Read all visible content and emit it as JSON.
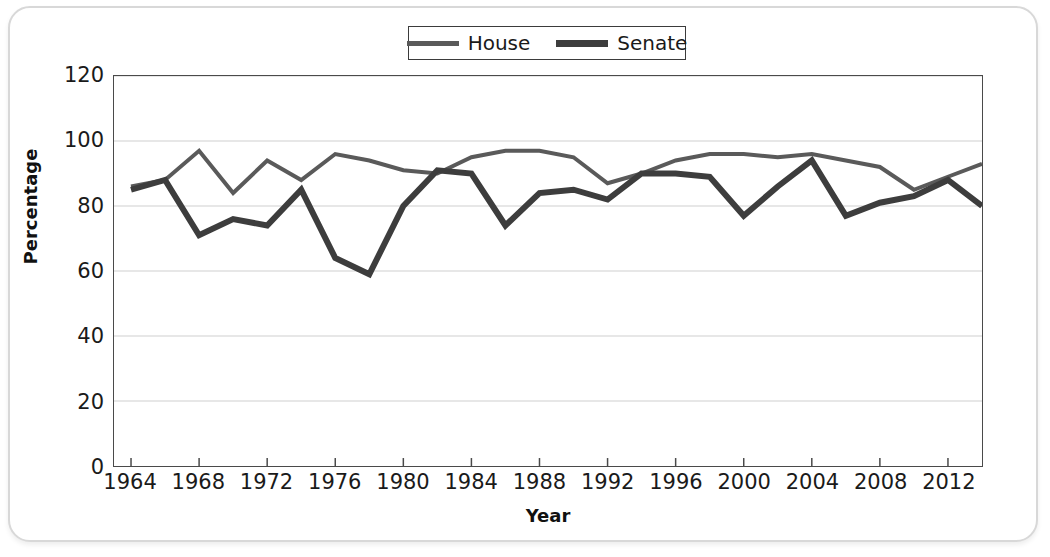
{
  "chart_data": {
    "type": "line",
    "title": "",
    "xlabel": "Year",
    "ylabel": "Percentage",
    "xlim": [
      1963,
      2014
    ],
    "ylim": [
      0,
      120
    ],
    "ytick_values": [
      0,
      20,
      40,
      60,
      80,
      100,
      120
    ],
    "ytick_labels": [
      "0",
      "20",
      "40",
      "60",
      "80",
      "100",
      "120"
    ],
    "xtick_values": [
      1964,
      1968,
      1972,
      1976,
      1980,
      1984,
      1988,
      1992,
      1996,
      2000,
      2004,
      2008,
      2012
    ],
    "xtick_labels": [
      "1964",
      "1968",
      "1972",
      "1976",
      "1980",
      "1984",
      "1988",
      "1992",
      "1996",
      "2000",
      "2004",
      "2008",
      "2012"
    ],
    "grid": "horizontal",
    "legend_position": "top-center",
    "x": [
      1964,
      1966,
      1968,
      1970,
      1972,
      1974,
      1976,
      1978,
      1980,
      1982,
      1984,
      1986,
      1988,
      1990,
      1992,
      1994,
      1996,
      1998,
      2000,
      2002,
      2004,
      2006,
      2008,
      2010,
      2012,
      2014
    ],
    "series": [
      {
        "name": "House",
        "color": "#5a5a5a",
        "line_width": 4,
        "values": [
          86,
          88,
          97,
          84,
          94,
          88,
          96,
          94,
          91,
          90,
          95,
          97,
          97,
          95,
          87,
          90,
          94,
          96,
          96,
          95,
          96,
          94,
          92,
          85,
          89,
          93
        ]
      },
      {
        "name": "Senate",
        "color": "#3d3d3d",
        "line_width": 6,
        "values": [
          85,
          88,
          71,
          76,
          74,
          85,
          64,
          59,
          80,
          91,
          90,
          74,
          84,
          85,
          82,
          90,
          90,
          89,
          77,
          86,
          94,
          77,
          81,
          83,
          88,
          80
        ]
      }
    ]
  },
  "legend": {
    "entries": [
      {
        "label": "House",
        "swatch": "house-line-swatch"
      },
      {
        "label": "Senate",
        "swatch": "senate-line-swatch"
      }
    ]
  }
}
